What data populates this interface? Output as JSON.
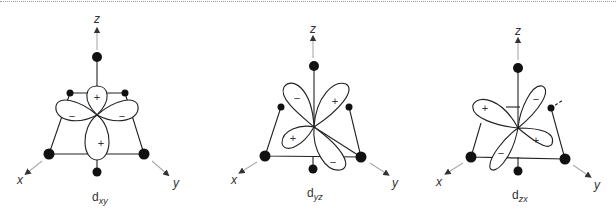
{
  "figure": {
    "line_color": "#222222",
    "ligand_color": "#111111",
    "panels": [
      {
        "id": "dxy",
        "caption_main": "d",
        "caption_sub": "xy",
        "axes": {
          "z": "z",
          "x": "x",
          "y": "y"
        },
        "lobe_signs": [
          "+",
          "−",
          "−",
          "+"
        ]
      },
      {
        "id": "dyz",
        "caption_main": "d",
        "caption_sub": "yz",
        "axes": {
          "z": "z",
          "x": "x",
          "y": "y"
        },
        "lobe_signs": [
          "−",
          "+",
          "+",
          "−"
        ]
      },
      {
        "id": "dzx",
        "caption_main": "d",
        "caption_sub": "zx",
        "axes": {
          "z": "z",
          "x": "x",
          "y": "y"
        },
        "lobe_signs": [
          "+",
          "−",
          "+",
          "−"
        ]
      }
    ]
  }
}
